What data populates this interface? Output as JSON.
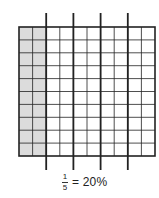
{
  "diagram": {
    "type": "hundred-grid-percent-model",
    "grid": {
      "rows": 10,
      "columns": 10,
      "shaded_columns": 2
    },
    "divider_lines": {
      "count": 4,
      "after_columns": [
        2,
        4,
        6,
        8
      ],
      "groups": 5
    },
    "colors": {
      "shade": "#dcdcdc",
      "line": "#222222",
      "background": "#ffffff"
    }
  },
  "caption": {
    "numerator": "1",
    "denominator": "5",
    "equals_text": "= 20%"
  }
}
